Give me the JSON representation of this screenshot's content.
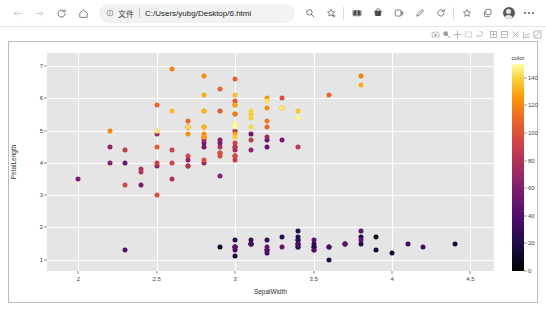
{
  "browser": {
    "nav": {
      "back_icon": "arrow-left-icon",
      "forward_icon": "arrow-right-icon",
      "reload_icon": "reload-icon",
      "home_icon": "home-icon"
    },
    "omnibox": {
      "info_icon": "info-circle-icon",
      "scheme_label": "文件",
      "url": "C:/Users/yubg/Desktop/6.html",
      "separator": "|"
    },
    "toolbar": [
      {
        "name": "zoom-out-icon",
        "label": ""
      },
      {
        "name": "add-to-favorites-icon",
        "label": ""
      },
      {
        "name": "split-screen-icon",
        "label": ""
      },
      {
        "name": "shopping-icon",
        "label": ""
      },
      {
        "name": "collections-icon",
        "label": ""
      },
      {
        "name": "pen-icon",
        "label": ""
      },
      {
        "name": "refresh-browser-icon",
        "label": ""
      },
      {
        "name": "favorites-star-icon",
        "label": ""
      },
      {
        "name": "collections-box-icon",
        "label": ""
      }
    ],
    "profile": {
      "avatar_icon": "avatar-icon"
    },
    "more_menu": {
      "label": "⋯"
    }
  },
  "modebar": {
    "buttons": [
      "camera-download-icon",
      "zoom-icon",
      "pan-icon",
      "box-select-icon",
      "lasso-select-icon",
      "zoom-in-icon",
      "zoom-out-icon",
      "autoscale-icon",
      "reset-axes-icon",
      "plotly-logo-icon"
    ]
  },
  "chart_data": {
    "type": "scatter",
    "title": "",
    "xlabel": "SepalWidth",
    "ylabel": "PetalLength",
    "xlim": [
      1.8,
      4.65
    ],
    "ylim": [
      0.65,
      7.4
    ],
    "xticks": [
      "2",
      "2.5",
      "3",
      "3.5",
      "4",
      "4.5"
    ],
    "xtick_values": [
      2,
      2.5,
      3,
      3.5,
      4,
      4.5
    ],
    "yticks": [
      "1",
      "2",
      "3",
      "4",
      "5",
      "6",
      "7"
    ],
    "ytick_values": [
      1,
      2,
      3,
      4,
      5,
      6,
      7
    ],
    "grid": true,
    "grid_color": "#ffffff",
    "plot_bgcolor": "#e5e5e5",
    "paper_bgcolor": "#ffffff",
    "marker_size": 5,
    "colorbar": {
      "title": "color",
      "ticks": [
        "0",
        "20",
        "40",
        "60",
        "80",
        "100",
        "120",
        "140"
      ],
      "tick_values": [
        0,
        20,
        40,
        60,
        80,
        100,
        120,
        140
      ],
      "cmin": 0,
      "cmax": 150,
      "colorscale": "viridis-dark-to-light",
      "orientation": "vertical",
      "position": "right"
    },
    "points": [
      {
        "x": 3.5,
        "y": 1.4,
        "c": 0
      },
      {
        "x": 3.0,
        "y": 1.4,
        "c": 1
      },
      {
        "x": 3.2,
        "y": 1.3,
        "c": 2
      },
      {
        "x": 3.1,
        "y": 1.5,
        "c": 3
      },
      {
        "x": 3.6,
        "y": 1.4,
        "c": 4
      },
      {
        "x": 3.9,
        "y": 1.7,
        "c": 5
      },
      {
        "x": 3.4,
        "y": 1.4,
        "c": 6
      },
      {
        "x": 3.4,
        "y": 1.5,
        "c": 7
      },
      {
        "x": 2.9,
        "y": 1.4,
        "c": 8
      },
      {
        "x": 3.1,
        "y": 1.5,
        "c": 9
      },
      {
        "x": 3.7,
        "y": 1.5,
        "c": 10
      },
      {
        "x": 3.4,
        "y": 1.6,
        "c": 11
      },
      {
        "x": 3.0,
        "y": 1.4,
        "c": 12
      },
      {
        "x": 3.0,
        "y": 1.1,
        "c": 13
      },
      {
        "x": 4.0,
        "y": 1.2,
        "c": 14
      },
      {
        "x": 4.4,
        "y": 1.5,
        "c": 15
      },
      {
        "x": 3.9,
        "y": 1.3,
        "c": 16
      },
      {
        "x": 3.5,
        "y": 1.4,
        "c": 17
      },
      {
        "x": 3.8,
        "y": 1.7,
        "c": 18
      },
      {
        "x": 3.8,
        "y": 1.5,
        "c": 19
      },
      {
        "x": 3.4,
        "y": 1.7,
        "c": 20
      },
      {
        "x": 3.7,
        "y": 1.5,
        "c": 21
      },
      {
        "x": 3.6,
        "y": 1.0,
        "c": 22
      },
      {
        "x": 3.3,
        "y": 1.7,
        "c": 23
      },
      {
        "x": 3.4,
        "y": 1.9,
        "c": 24
      },
      {
        "x": 3.0,
        "y": 1.6,
        "c": 25
      },
      {
        "x": 3.4,
        "y": 1.6,
        "c": 26
      },
      {
        "x": 3.5,
        "y": 1.5,
        "c": 27
      },
      {
        "x": 3.4,
        "y": 1.4,
        "c": 28
      },
      {
        "x": 3.2,
        "y": 1.6,
        "c": 29
      },
      {
        "x": 3.1,
        "y": 1.6,
        "c": 30
      },
      {
        "x": 3.4,
        "y": 1.5,
        "c": 31
      },
      {
        "x": 4.1,
        "y": 1.5,
        "c": 32
      },
      {
        "x": 4.2,
        "y": 1.4,
        "c": 33
      },
      {
        "x": 3.1,
        "y": 1.5,
        "c": 34
      },
      {
        "x": 3.2,
        "y": 1.2,
        "c": 35
      },
      {
        "x": 3.5,
        "y": 1.3,
        "c": 36
      },
      {
        "x": 3.6,
        "y": 1.4,
        "c": 37
      },
      {
        "x": 3.0,
        "y": 1.3,
        "c": 38
      },
      {
        "x": 3.4,
        "y": 1.5,
        "c": 39
      },
      {
        "x": 3.5,
        "y": 1.3,
        "c": 40
      },
      {
        "x": 2.3,
        "y": 1.3,
        "c": 41
      },
      {
        "x": 3.2,
        "y": 1.3,
        "c": 42
      },
      {
        "x": 3.5,
        "y": 1.6,
        "c": 43
      },
      {
        "x": 3.8,
        "y": 1.9,
        "c": 44
      },
      {
        "x": 3.0,
        "y": 1.4,
        "c": 45
      },
      {
        "x": 3.8,
        "y": 1.6,
        "c": 46
      },
      {
        "x": 3.2,
        "y": 1.4,
        "c": 47
      },
      {
        "x": 3.7,
        "y": 1.5,
        "c": 48
      },
      {
        "x": 3.3,
        "y": 1.4,
        "c": 49
      },
      {
        "x": 3.2,
        "y": 4.7,
        "c": 50
      },
      {
        "x": 3.2,
        "y": 4.5,
        "c": 51
      },
      {
        "x": 3.1,
        "y": 4.9,
        "c": 52
      },
      {
        "x": 2.3,
        "y": 4.0,
        "c": 53
      },
      {
        "x": 2.8,
        "y": 4.6,
        "c": 54
      },
      {
        "x": 2.8,
        "y": 4.5,
        "c": 55
      },
      {
        "x": 3.3,
        "y": 4.7,
        "c": 56
      },
      {
        "x": 2.4,
        "y": 3.3,
        "c": 57
      },
      {
        "x": 2.9,
        "y": 4.6,
        "c": 58
      },
      {
        "x": 2.7,
        "y": 3.9,
        "c": 59
      },
      {
        "x": 2.0,
        "y": 3.5,
        "c": 60
      },
      {
        "x": 3.0,
        "y": 4.2,
        "c": 61
      },
      {
        "x": 2.2,
        "y": 4.0,
        "c": 62
      },
      {
        "x": 2.9,
        "y": 4.7,
        "c": 63
      },
      {
        "x": 2.9,
        "y": 3.6,
        "c": 64
      },
      {
        "x": 3.1,
        "y": 4.4,
        "c": 65
      },
      {
        "x": 3.0,
        "y": 4.5,
        "c": 66
      },
      {
        "x": 2.7,
        "y": 4.1,
        "c": 67
      },
      {
        "x": 2.2,
        "y": 4.5,
        "c": 68
      },
      {
        "x": 2.5,
        "y": 3.9,
        "c": 69
      },
      {
        "x": 3.2,
        "y": 4.8,
        "c": 70
      },
      {
        "x": 2.8,
        "y": 4.0,
        "c": 71
      },
      {
        "x": 2.5,
        "y": 4.9,
        "c": 72
      },
      {
        "x": 2.8,
        "y": 4.7,
        "c": 73
      },
      {
        "x": 2.9,
        "y": 4.3,
        "c": 74
      },
      {
        "x": 3.0,
        "y": 4.4,
        "c": 75
      },
      {
        "x": 2.8,
        "y": 4.8,
        "c": 76
      },
      {
        "x": 3.0,
        "y": 5.0,
        "c": 77
      },
      {
        "x": 2.9,
        "y": 4.5,
        "c": 78
      },
      {
        "x": 2.6,
        "y": 3.5,
        "c": 79
      },
      {
        "x": 2.4,
        "y": 3.8,
        "c": 80
      },
      {
        "x": 2.4,
        "y": 3.7,
        "c": 81
      },
      {
        "x": 2.7,
        "y": 3.9,
        "c": 82
      },
      {
        "x": 2.7,
        "y": 5.1,
        "c": 83
      },
      {
        "x": 3.0,
        "y": 4.5,
        "c": 84
      },
      {
        "x": 3.4,
        "y": 4.5,
        "c": 85
      },
      {
        "x": 3.1,
        "y": 4.7,
        "c": 86
      },
      {
        "x": 2.3,
        "y": 4.4,
        "c": 87
      },
      {
        "x": 3.0,
        "y": 4.1,
        "c": 88
      },
      {
        "x": 2.5,
        "y": 4.0,
        "c": 89
      },
      {
        "x": 2.6,
        "y": 4.4,
        "c": 90
      },
      {
        "x": 3.0,
        "y": 4.6,
        "c": 91
      },
      {
        "x": 2.6,
        "y": 4.0,
        "c": 92
      },
      {
        "x": 2.3,
        "y": 3.3,
        "c": 93
      },
      {
        "x": 2.7,
        "y": 4.2,
        "c": 94
      },
      {
        "x": 3.0,
        "y": 4.2,
        "c": 95
      },
      {
        "x": 2.9,
        "y": 4.2,
        "c": 96
      },
      {
        "x": 2.9,
        "y": 4.3,
        "c": 97
      },
      {
        "x": 2.5,
        "y": 3.0,
        "c": 98
      },
      {
        "x": 2.8,
        "y": 4.1,
        "c": 99
      },
      {
        "x": 3.3,
        "y": 6.0,
        "c": 100
      },
      {
        "x": 2.7,
        "y": 5.1,
        "c": 101
      },
      {
        "x": 3.0,
        "y": 5.9,
        "c": 102
      },
      {
        "x": 2.9,
        "y": 5.6,
        "c": 103
      },
      {
        "x": 3.0,
        "y": 5.8,
        "c": 104
      },
      {
        "x": 3.0,
        "y": 6.6,
        "c": 105
      },
      {
        "x": 2.5,
        "y": 4.5,
        "c": 106
      },
      {
        "x": 2.9,
        "y": 6.3,
        "c": 107
      },
      {
        "x": 2.5,
        "y": 5.8,
        "c": 108
      },
      {
        "x": 3.6,
        "y": 6.1,
        "c": 109
      },
      {
        "x": 3.2,
        "y": 5.1,
        "c": 110
      },
      {
        "x": 2.7,
        "y": 5.3,
        "c": 111
      },
      {
        "x": 3.0,
        "y": 5.5,
        "c": 112
      },
      {
        "x": 2.5,
        "y": 5.0,
        "c": 113
      },
      {
        "x": 2.8,
        "y": 5.1,
        "c": 114
      },
      {
        "x": 3.2,
        "y": 5.3,
        "c": 115
      },
      {
        "x": 3.0,
        "y": 5.5,
        "c": 116
      },
      {
        "x": 3.8,
        "y": 6.7,
        "c": 117
      },
      {
        "x": 2.6,
        "y": 6.9,
        "c": 118
      },
      {
        "x": 2.2,
        "y": 5.0,
        "c": 119
      },
      {
        "x": 3.2,
        "y": 5.7,
        "c": 120
      },
      {
        "x": 2.8,
        "y": 4.9,
        "c": 121
      },
      {
        "x": 2.8,
        "y": 6.7,
        "c": 122
      },
      {
        "x": 2.7,
        "y": 4.9,
        "c": 123
      },
      {
        "x": 3.3,
        "y": 5.7,
        "c": 124
      },
      {
        "x": 3.2,
        "y": 6.0,
        "c": 125
      },
      {
        "x": 2.8,
        "y": 4.8,
        "c": 126
      },
      {
        "x": 3.0,
        "y": 4.9,
        "c": 127
      },
      {
        "x": 2.8,
        "y": 5.6,
        "c": 128
      },
      {
        "x": 3.0,
        "y": 5.8,
        "c": 129
      },
      {
        "x": 2.8,
        "y": 6.1,
        "c": 130
      },
      {
        "x": 3.8,
        "y": 6.4,
        "c": 131
      },
      {
        "x": 2.8,
        "y": 5.6,
        "c": 132
      },
      {
        "x": 2.8,
        "y": 5.1,
        "c": 133
      },
      {
        "x": 2.6,
        "y": 5.6,
        "c": 134
      },
      {
        "x": 3.0,
        "y": 6.1,
        "c": 135
      },
      {
        "x": 3.4,
        "y": 5.6,
        "c": 136
      },
      {
        "x": 3.1,
        "y": 5.5,
        "c": 137
      },
      {
        "x": 3.0,
        "y": 4.8,
        "c": 138
      },
      {
        "x": 3.1,
        "y": 5.4,
        "c": 139
      },
      {
        "x": 3.1,
        "y": 5.6,
        "c": 140
      },
      {
        "x": 3.1,
        "y": 5.1,
        "c": 141
      },
      {
        "x": 2.7,
        "y": 5.1,
        "c": 142
      },
      {
        "x": 3.2,
        "y": 5.9,
        "c": 143
      },
      {
        "x": 3.3,
        "y": 5.7,
        "c": 144
      },
      {
        "x": 3.0,
        "y": 5.2,
        "c": 145
      },
      {
        "x": 2.5,
        "y": 5.0,
        "c": 146
      },
      {
        "x": 3.0,
        "y": 5.2,
        "c": 147
      },
      {
        "x": 3.4,
        "y": 5.4,
        "c": 148
      },
      {
        "x": 3.0,
        "y": 5.1,
        "c": 149
      }
    ]
  }
}
